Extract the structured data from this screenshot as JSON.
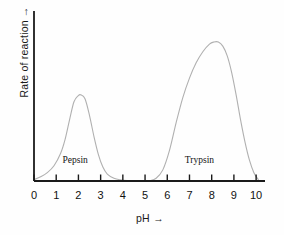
{
  "figure": {
    "background_color": "#fefefe",
    "axis_color": "#1a1a1a",
    "curve_color": "#b0b0b0"
  },
  "axes": {
    "y_title": "Rate of reaction  →",
    "x_title": "pH   →",
    "x_ticks": [
      "0",
      "1",
      "2",
      "3",
      "4",
      "5",
      "6",
      "7",
      "8",
      "9",
      "10"
    ]
  },
  "annotations": {
    "pepsin_label": "Pepsin",
    "trypsin_label": "Trypsin"
  },
  "chart_data": {
    "type": "line",
    "title": "",
    "xlabel": "pH  →",
    "ylabel": "Rate of reaction  →",
    "xlim": [
      0,
      10.4
    ],
    "ylim": [
      0,
      1.05
    ],
    "grid": false,
    "legend": "inline-curve-labels",
    "x_ticks": [
      0,
      1,
      2,
      3,
      4,
      5,
      6,
      7,
      8,
      9,
      10
    ],
    "y_ticks": [],
    "series": [
      {
        "name": "Pepsin",
        "color": "#b0b0b0",
        "peak_ph": 2.1,
        "peak_value": 0.62,
        "label_position": {
          "ph": 2.05,
          "value": 0.09
        },
        "x": [
          0.0,
          0.3,
          0.6,
          0.9,
          1.2,
          1.4,
          1.6,
          1.8,
          2.0,
          2.1,
          2.3,
          2.5,
          2.7,
          2.9,
          3.1,
          3.3,
          3.6,
          3.9,
          4.2,
          4.6,
          5.0
        ],
        "y": [
          0.01,
          0.03,
          0.06,
          0.11,
          0.2,
          0.3,
          0.44,
          0.57,
          0.615,
          0.62,
          0.59,
          0.47,
          0.32,
          0.19,
          0.1,
          0.05,
          0.02,
          0.008,
          0.003,
          0.001,
          0.0
        ]
      },
      {
        "name": "Trypsin",
        "color": "#b0b0b0",
        "peak_ph": 8.3,
        "peak_value": 1.0,
        "label_position": {
          "ph": 7.6,
          "value": 0.09
        },
        "x": [
          5.2,
          5.5,
          5.8,
          6.1,
          6.4,
          6.7,
          7.0,
          7.3,
          7.6,
          7.9,
          8.1,
          8.3,
          8.5,
          8.7,
          8.9,
          9.1,
          9.3,
          9.5,
          9.7,
          9.9,
          10.1
        ],
        "y": [
          0.0,
          0.02,
          0.08,
          0.22,
          0.42,
          0.6,
          0.74,
          0.85,
          0.93,
          0.985,
          1.0,
          1.0,
          0.97,
          0.9,
          0.78,
          0.62,
          0.44,
          0.28,
          0.15,
          0.06,
          0.01
        ]
      }
    ]
  }
}
